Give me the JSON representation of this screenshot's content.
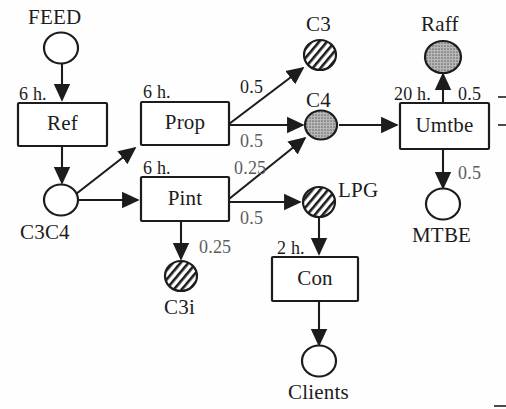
{
  "diagram": {
    "type": "petri-net-process-flow",
    "title": "",
    "background_color": "#fefefe",
    "ink_color": "#1c1c1c",
    "places": [
      {
        "id": "feed",
        "label": "FEED",
        "shape": "circle",
        "fill": "white",
        "cx": 60,
        "cy": 48,
        "rx": 17,
        "ry": 15,
        "label_pos": "above"
      },
      {
        "id": "c3c4",
        "label": "C3C4",
        "shape": "circle",
        "fill": "white",
        "cx": 60,
        "cy": 200,
        "rx": 17,
        "ry": 15,
        "label_pos": "below"
      },
      {
        "id": "c3",
        "label": "C3",
        "shape": "circle",
        "fill": "hatched",
        "cx": 322,
        "cy": 55,
        "rx": 16,
        "ry": 15,
        "label_pos": "above"
      },
      {
        "id": "c4",
        "label": "C4",
        "shape": "circle",
        "fill": "dotted",
        "cx": 322,
        "cy": 125,
        "rx": 16,
        "ry": 15,
        "label_pos": "above"
      },
      {
        "id": "c3i",
        "label": "C3i",
        "shape": "circle",
        "fill": "hatched",
        "cx": 181,
        "cy": 276,
        "rx": 16,
        "ry": 15,
        "label_pos": "below"
      },
      {
        "id": "lpg",
        "label": "LPG",
        "shape": "circle",
        "fill": "hatched",
        "cx": 319,
        "cy": 202,
        "rx": 16,
        "ry": 15,
        "label_pos": "right"
      },
      {
        "id": "raff",
        "label": "Raff",
        "shape": "circle",
        "fill": "dotted",
        "cx": 442,
        "cy": 56,
        "rx": 18,
        "ry": 16,
        "label_pos": "above"
      },
      {
        "id": "mtbe",
        "label": "MTBE",
        "shape": "circle",
        "fill": "white",
        "cx": 442,
        "cy": 205,
        "rx": 17,
        "ry": 15,
        "label_pos": "below"
      },
      {
        "id": "clients",
        "label": "Clients",
        "shape": "circle",
        "fill": "white",
        "cx": 319,
        "cy": 362,
        "rx": 17,
        "ry": 15,
        "label_pos": "below"
      }
    ],
    "transitions": [
      {
        "id": "ref",
        "label": "Ref",
        "x": 18,
        "y": 103,
        "w": 89,
        "h": 43,
        "time": "6 h.",
        "time_pos": "top-left"
      },
      {
        "id": "prop",
        "label": "Prop",
        "x": 141,
        "y": 102,
        "w": 88,
        "h": 43,
        "time": "6 h.",
        "time_pos": "top-left"
      },
      {
        "id": "pint",
        "label": "Pint",
        "x": 141,
        "y": 177,
        "w": 88,
        "h": 44,
        "time": "6 h.",
        "time_pos": "top-left"
      },
      {
        "id": "con",
        "label": "Con",
        "x": 272,
        "y": 257,
        "w": 86,
        "h": 44,
        "time": "2 h.",
        "time_pos": "top-left"
      },
      {
        "id": "umtbe",
        "label": "Umtbe",
        "x": 400,
        "y": 103,
        "w": 89,
        "h": 46,
        "time": "20 h.",
        "time_pos": "top-left"
      }
    ],
    "arcs": [
      {
        "id": "feed-ref",
        "from": "feed",
        "to": "ref",
        "weight": ""
      },
      {
        "id": "ref-c3c4",
        "from": "ref",
        "to": "c3c4",
        "weight": ""
      },
      {
        "id": "c3c4-prop",
        "from": "c3c4",
        "to": "prop",
        "weight": ""
      },
      {
        "id": "c3c4-pint",
        "from": "c3c4",
        "to": "pint",
        "weight": ""
      },
      {
        "id": "prop-c3",
        "from": "prop",
        "to": "c3",
        "weight": "0.5"
      },
      {
        "id": "prop-c4",
        "from": "prop",
        "to": "c4",
        "weight": "0.5"
      },
      {
        "id": "pint-c4",
        "from": "pint",
        "to": "c4",
        "weight": "0.25"
      },
      {
        "id": "pint-lpg",
        "from": "pint",
        "to": "lpg",
        "weight": "0.5"
      },
      {
        "id": "pint-c3i",
        "from": "pint",
        "to": "c3i",
        "weight": "0.25"
      },
      {
        "id": "c4-umtbe",
        "from": "c4",
        "to": "umtbe",
        "weight": ""
      },
      {
        "id": "umtbe-raff",
        "from": "umtbe",
        "to": "raff",
        "weight": "0.5"
      },
      {
        "id": "umtbe-mtbe",
        "from": "umtbe",
        "to": "mtbe",
        "weight": "0.5"
      },
      {
        "id": "lpg-con",
        "from": "lpg",
        "to": "con",
        "weight": ""
      },
      {
        "id": "con-clients",
        "from": "con",
        "to": "clients",
        "weight": ""
      }
    ],
    "labels": {
      "feed": "FEED",
      "c3c4": "C3C4",
      "c3": "C3",
      "c4": "C4",
      "c3i": "C3i",
      "lpg": "LPG",
      "raff": "Raff",
      "mtbe": "MTBE",
      "clients": "Clients",
      "ref": "Ref",
      "prop": "Prop",
      "pint": "Pint",
      "con": "Con",
      "umtbe": "Umtbe"
    },
    "times": {
      "ref": "6 h.",
      "prop": "6 h.",
      "pint": "6 h.",
      "con": "2 h.",
      "umtbe": "20 h."
    },
    "weights": {
      "prop_c3": "0.5",
      "prop_c4": "0.5",
      "pint_c4": "0.25",
      "pint_lpg": "0.5",
      "pint_c3i": "0.25",
      "umtbe_raff": "0.5",
      "umtbe_mtbe": "0.5"
    }
  }
}
